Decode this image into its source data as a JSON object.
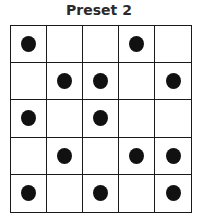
{
  "title": "Preset 2",
  "grid": {
    "rows": 5,
    "cols": 5,
    "dot_color": "#111111",
    "line_color": "#1a1a1a",
    "cells": [
      [
        1,
        0,
        0,
        1,
        0
      ],
      [
        0,
        1,
        1,
        0,
        1
      ],
      [
        1,
        0,
        1,
        0,
        0
      ],
      [
        0,
        1,
        0,
        1,
        1
      ],
      [
        1,
        0,
        1,
        0,
        1
      ]
    ]
  }
}
